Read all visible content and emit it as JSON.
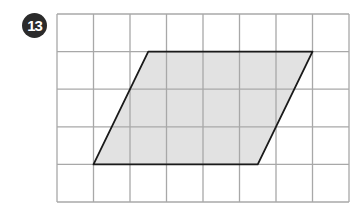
{
  "problem": {
    "number": "13",
    "badge_color": "#2b2b2b"
  },
  "grid": {
    "columns": 8,
    "rows": 5,
    "origin_x": 57,
    "origin_y": 14,
    "cell_width": 36.5,
    "cell_height": 37.6,
    "line_color": "#a8a8a8"
  },
  "shape": {
    "type": "parallelogram",
    "vertices_grid_units": [
      [
        2.5,
        1
      ],
      [
        7,
        1
      ],
      [
        5.5,
        4
      ],
      [
        1,
        4
      ]
    ],
    "fill": "#e2e2e2",
    "stroke": "#1a1a1a"
  }
}
